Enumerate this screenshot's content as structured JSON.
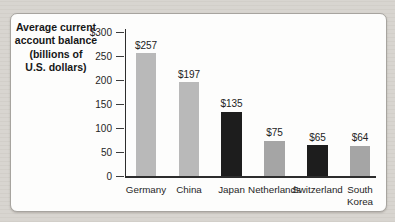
{
  "figure": {
    "panel_background": "#fdfdfc",
    "page_background": "#d8d5d0"
  },
  "chart_data": {
    "type": "bar",
    "title": "Average current account balance (billions of U.S. dollars)",
    "title_lines": [
      "Average current",
      "account balance",
      "(billions of",
      "U.S. dollars)"
    ],
    "categories": [
      "Germany",
      "China",
      "Japan",
      "Netherlands",
      "Switzerland",
      "South Korea"
    ],
    "values": [
      257,
      197,
      135,
      75,
      65,
      64
    ],
    "value_labels": [
      "$257",
      "$197",
      "$135",
      "$75",
      "$65",
      "$64"
    ],
    "bar_colors": [
      "#b9b9b9",
      "#b9b9b9",
      "#1d1d1d",
      "#a5a5a5",
      "#1d1d1d",
      "#a5a5a5"
    ],
    "ylim": [
      0,
      300
    ],
    "ytick_values": [
      300,
      250,
      200,
      150,
      100,
      50,
      0
    ],
    "ytick_labels": [
      "$300",
      "250",
      "200",
      "150",
      "100",
      "50",
      "0"
    ],
    "xlabel": "",
    "ylabel": "",
    "grid": false,
    "legend": "none"
  }
}
